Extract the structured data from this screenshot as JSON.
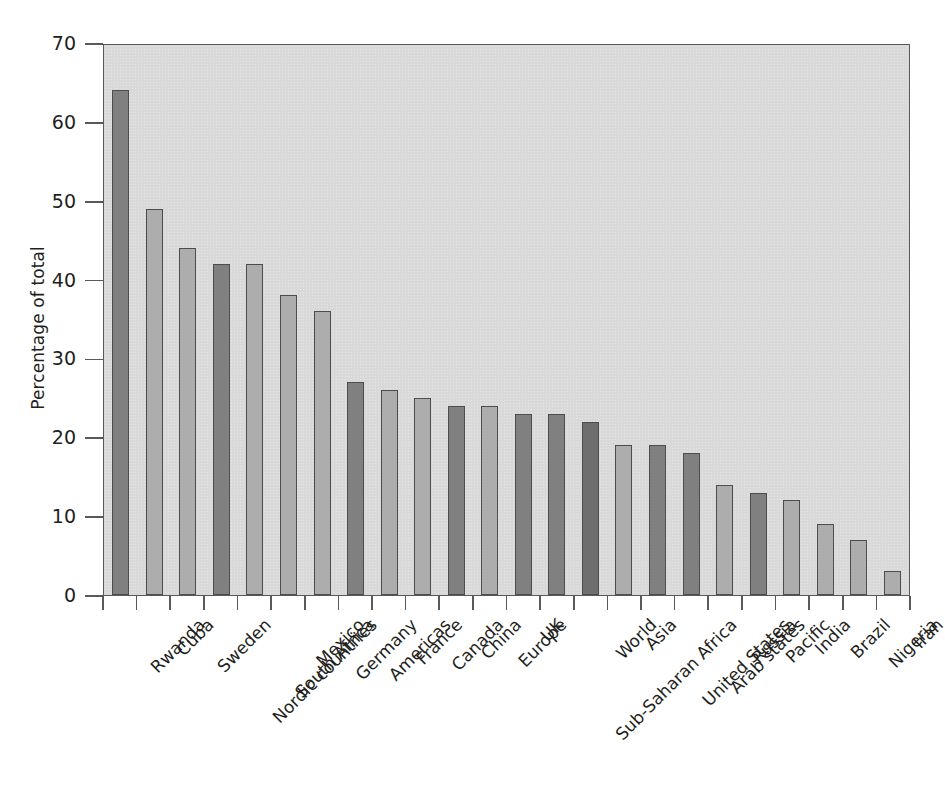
{
  "chart_data": {
    "type": "bar",
    "title": "",
    "xlabel": "",
    "ylabel": "Percentage of total",
    "ylim": [
      0,
      70
    ],
    "ytick_values": [
      0,
      10,
      20,
      30,
      40,
      50,
      60,
      70
    ],
    "ytick_labels": [
      "0",
      "10",
      "20",
      "30",
      "40",
      "50",
      "60",
      "70"
    ],
    "grid": false,
    "legend": "none",
    "panel_background": "#d9d9d9",
    "bar_shades": {
      "light": "#adadad",
      "dark": "#808080",
      "darkest": "#6e6e6e",
      "outline": "#4c4d4f"
    },
    "categories": [
      "Rwanda",
      "Cuba",
      "Sweden",
      "Nordic countries",
      "South Africa",
      "Mexico",
      "Germany",
      "Americas",
      "France",
      "Canada",
      "China",
      "Europe",
      "UK",
      "Sub-Saharan Africa",
      "World",
      "Asia",
      "United States",
      "Arab states",
      "Russia",
      "Pacific",
      "India",
      "Brazil",
      "Nigeria",
      "Iran"
    ],
    "values": [
      64,
      49,
      44,
      42,
      42,
      38,
      36,
      27,
      26,
      25,
      24,
      24,
      23,
      23,
      22,
      19,
      19,
      18,
      14,
      13,
      12,
      9,
      7,
      3
    ],
    "shades": [
      "dark",
      "light",
      "light",
      "dark",
      "light",
      "light",
      "light",
      "dark",
      "light",
      "light",
      "dark",
      "light",
      "dark",
      "dark",
      "darkest",
      "light",
      "dark",
      "dark",
      "light",
      "dark",
      "light",
      "light",
      "light",
      "light"
    ]
  }
}
